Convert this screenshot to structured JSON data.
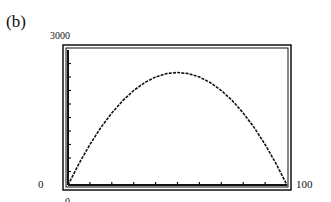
{
  "panel_label": "(b)",
  "axes": {
    "y_max_label": "3000",
    "y_min_label": "0",
    "x_min_label": "0",
    "x_max_label": "100"
  },
  "colors": {
    "line": "#111111",
    "background": "#ffffff"
  },
  "chart_data": {
    "type": "line",
    "title": "(b)",
    "xlabel": "",
    "ylabel": "",
    "xlim": [
      0,
      100
    ],
    "ylim": [
      0,
      3000
    ],
    "x_tick_step": 10,
    "y_tick_step": 300,
    "grid": false,
    "legend": null,
    "series": [
      {
        "name": "curve",
        "x": [
          0,
          5,
          10,
          15,
          20,
          25,
          30,
          35,
          40,
          45,
          50,
          55,
          60,
          65,
          70,
          75,
          80,
          85,
          90,
          95,
          100
        ],
        "values": [
          0,
          475,
          900,
          1275,
          1600,
          1875,
          2100,
          2275,
          2400,
          2475,
          2500,
          2475,
          2400,
          2275,
          2100,
          1875,
          1600,
          1275,
          900,
          475,
          0
        ]
      }
    ],
    "annotations": [
      "graphing calculator style window, flat-looking top near x=40..60"
    ]
  }
}
